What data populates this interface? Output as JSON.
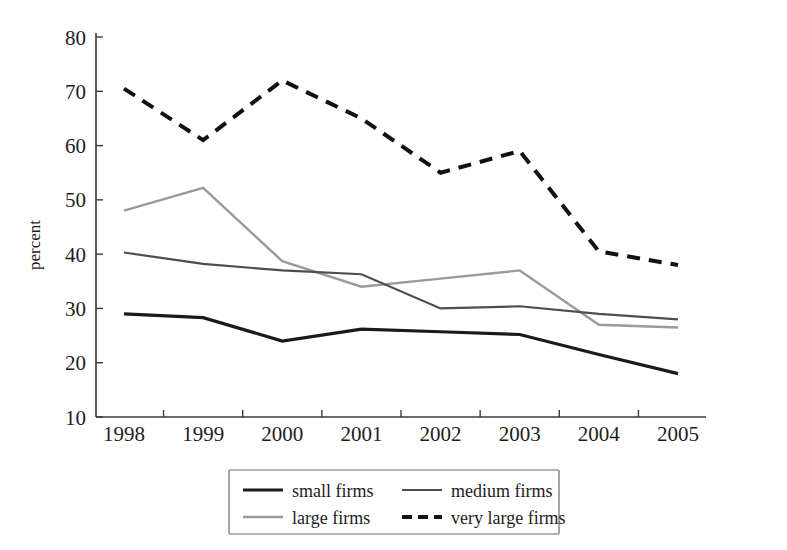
{
  "chart_data": {
    "type": "line",
    "title": "",
    "xlabel": "",
    "ylabel": "percent",
    "categories": [
      "1998",
      "1999",
      "2000",
      "2001",
      "2002",
      "2003",
      "2004",
      "2005"
    ],
    "ylim": [
      10,
      80
    ],
    "yticks": [
      10,
      20,
      30,
      40,
      50,
      60,
      70,
      80
    ],
    "ytick_labels": [
      "10",
      "20",
      "30",
      "40",
      "50",
      "60",
      "70",
      "80"
    ],
    "grid": false,
    "legend_position": "bottom-center",
    "series": [
      {
        "name": "small firms",
        "values": [
          29.0,
          28.3,
          24.0,
          26.2,
          25.7,
          25.2,
          21.5,
          18.0
        ],
        "color": "#1a1a1a",
        "width": 3.2,
        "dash": "none"
      },
      {
        "name": "medium firms",
        "values": [
          40.3,
          38.2,
          37.0,
          36.3,
          30.0,
          30.4,
          29.0,
          28.0
        ],
        "color": "#4d4d4d",
        "width": 2.2,
        "dash": "none"
      },
      {
        "name": "large firms",
        "values": [
          48.0,
          52.2,
          38.7,
          34.0,
          35.5,
          37.0,
          27.0,
          26.5
        ],
        "color": "#9a9a9a",
        "width": 2.4,
        "dash": "none"
      },
      {
        "name": "very large firms",
        "values": [
          70.5,
          61.0,
          72.0,
          65.0,
          55.0,
          59.0,
          40.5,
          38.0
        ],
        "color": "#111111",
        "width": 4.0,
        "dash": "13,9"
      }
    ]
  },
  "legend": {
    "entries": [
      {
        "label": "small firms"
      },
      {
        "label": "medium firms"
      },
      {
        "label": "large firms"
      },
      {
        "label": "very large firms"
      }
    ]
  }
}
